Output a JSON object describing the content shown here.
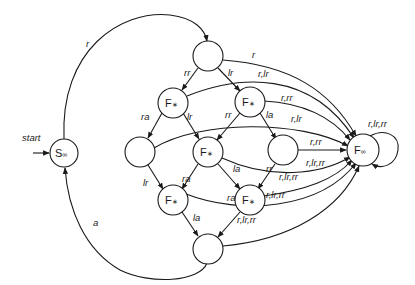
{
  "diagram": {
    "type": "finite-state-automaton",
    "start_label": "start",
    "nodes": {
      "s_inf": {
        "label": "S",
        "sub": "∞"
      },
      "top": {
        "label": ""
      },
      "f1": {
        "label": "F",
        "sub": "∗"
      },
      "f2": {
        "label": "F",
        "sub": "∗"
      },
      "left": {
        "label": ""
      },
      "f3": {
        "label": "F",
        "sub": "∗"
      },
      "right": {
        "label": ""
      },
      "f4": {
        "label": "F",
        "sub": "∗"
      },
      "f5": {
        "label": "F",
        "sub": "∗"
      },
      "bottom": {
        "label": ""
      },
      "f_inf": {
        "label": "F",
        "sub": "∞"
      }
    },
    "edges": {
      "s_to_top": "r",
      "bottom_to_s": "a",
      "top_to_f1": "rr",
      "top_to_f2": "lr",
      "top_to_finf": "r",
      "f1_to_left": "ra",
      "f1_to_f3": "lr",
      "f1_to_finf": "r,lr",
      "f2_to_f3": "rr",
      "f2_to_right": "la",
      "f2_to_finf": "r,rr",
      "left_to_f4": "lr",
      "left_to_finf": "r,lr",
      "right_to_finf": "r,rr",
      "f3_to_f4": "ra",
      "f3_to_f5": "la",
      "f3_to_finf": "r,lr,rr",
      "right_to_f5": "rr",
      "f5_to_finf": "r,lr,rr",
      "f4_to_bottom": "la",
      "f4_to_finf": "r,lr,rr",
      "f5_to_bottom": "ra",
      "bottom_to_finf": "r,lr,rr",
      "finf_self": "r,lr,rr"
    }
  }
}
